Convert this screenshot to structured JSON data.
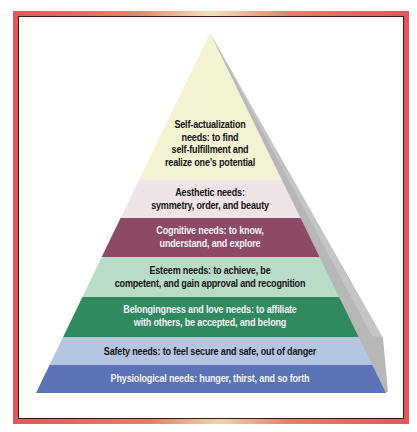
{
  "diagram": {
    "type": "pyramid",
    "title": "",
    "levels": [
      {
        "name": "Self-actualization",
        "lines": [
          "Self-actualization",
          "needs: to find",
          "self-fulfillment and",
          "realize one’s potential"
        ],
        "color": "#f3f2d2"
      },
      {
        "name": "Aesthetic",
        "lines": [
          "Aesthetic needs:",
          "symmetry, order, and beauty"
        ],
        "color": "#efe4e6"
      },
      {
        "name": "Cognitive",
        "lines": [
          "Cognitive needs: to know,",
          "understand, and explore"
        ],
        "color": "#8c4a64"
      },
      {
        "name": "Esteem",
        "lines": [
          "Esteem needs: to achieve, be",
          "competent, and gain approval and recognition"
        ],
        "color": "#b9dcc8"
      },
      {
        "name": "Belongingness and love",
        "lines": [
          "Belongingness and love needs: to affiliate",
          "with others, be accepted, and belong"
        ],
        "color": "#2f8a5e"
      },
      {
        "name": "Safety",
        "lines": [
          "Safety needs: to feel secure and safe, out of danger"
        ],
        "color": "#b4c6e2"
      },
      {
        "name": "Physiological",
        "lines": [
          "Physiological needs: hunger, thirst, and so forth"
        ],
        "color": "#5b72b6"
      }
    ],
    "side_color": "#b9b9b9",
    "frame_color": "#e0585a"
  }
}
